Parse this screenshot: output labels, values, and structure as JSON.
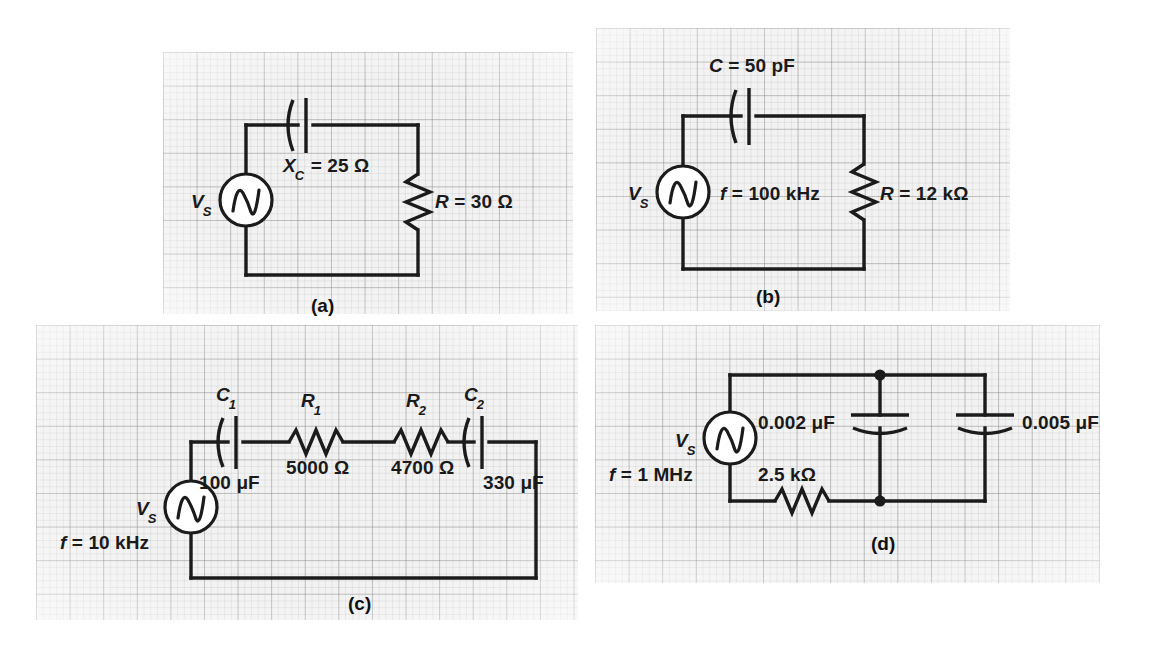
{
  "figure": {
    "type": "circuit-diagram-set",
    "panel_count": 4,
    "background": "#f2f2f2",
    "ink_color": "#1b1b1b"
  },
  "panels": [
    {
      "id": "a",
      "caption": "(a)",
      "source_label": "V",
      "source_sub": "S",
      "labels": [
        {
          "name": "reactance",
          "main": "X",
          "sub": "C",
          "rest": " = 25 Ω"
        },
        {
          "name": "resistance",
          "main": "R",
          "sub": "",
          "rest": " = 30 Ω"
        }
      ],
      "components": [
        "voltage-source",
        "capacitor",
        "resistor"
      ]
    },
    {
      "id": "b",
      "caption": "(b)",
      "source_label": "V",
      "source_sub": "S",
      "labels": [
        {
          "name": "capacitance",
          "main": "C",
          "sub": "",
          "rest": " = 50 pF"
        },
        {
          "name": "frequency",
          "main": "f",
          "sub": "",
          "rest": " = 100 kHz"
        },
        {
          "name": "resistance",
          "main": "R",
          "sub": "",
          "rest": " = 12 kΩ"
        }
      ],
      "components": [
        "voltage-source",
        "capacitor",
        "resistor"
      ]
    },
    {
      "id": "c",
      "caption": "(c)",
      "source_label": "V",
      "source_sub": "S",
      "labels": [
        {
          "name": "cap1-ref",
          "main": "C",
          "sub": "1",
          "rest": ""
        },
        {
          "name": "res1-ref",
          "main": "R",
          "sub": "1",
          "rest": ""
        },
        {
          "name": "res2-ref",
          "main": "R",
          "sub": "2",
          "rest": ""
        },
        {
          "name": "cap2-ref",
          "main": "C",
          "sub": "2",
          "rest": ""
        },
        {
          "name": "cap1-value",
          "main": "",
          "sub": "",
          "rest": "100 μF"
        },
        {
          "name": "res1-value",
          "main": "",
          "sub": "",
          "rest": "5000 Ω"
        },
        {
          "name": "res2-value",
          "main": "",
          "sub": "",
          "rest": "4700 Ω"
        },
        {
          "name": "cap2-value",
          "main": "",
          "sub": "",
          "rest": "330 μF"
        },
        {
          "name": "frequency",
          "main": "f",
          "sub": "",
          "rest": " = 10 kHz"
        }
      ],
      "components": [
        "voltage-source",
        "capacitor",
        "resistor",
        "resistor",
        "capacitor"
      ]
    },
    {
      "id": "d",
      "caption": "(d)",
      "source_label": "V",
      "source_sub": "S",
      "labels": [
        {
          "name": "frequency",
          "main": "f",
          "sub": "",
          "rest": " = 1 MHz"
        },
        {
          "name": "cap1-value",
          "main": "",
          "sub": "",
          "rest": "0.002 μF"
        },
        {
          "name": "cap2-value",
          "main": "",
          "sub": "",
          "rest": "0.005 μF"
        },
        {
          "name": "res-value",
          "main": "",
          "sub": "",
          "rest": "2.5 kΩ"
        }
      ],
      "components": [
        "voltage-source",
        "resistor",
        "capacitor",
        "capacitor"
      ]
    }
  ]
}
